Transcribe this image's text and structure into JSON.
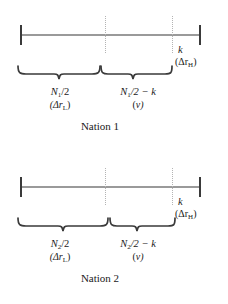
{
  "figure": {
    "type": "diagram",
    "background_color": "#ffffff",
    "axis_color": "#9a9a9a",
    "tick_color": "#3a3a3a",
    "divider_color": "#b4b4b4",
    "brace_color": "#3a3a3a",
    "text_color": "#1a1a1a"
  },
  "panels": [
    {
      "id": "nation-1",
      "caption": "Nation 1",
      "axis": {
        "left_tick_label": "",
        "right_tick_label": "",
        "dividers": 2
      },
      "endpoint_label": {
        "symbol": "k",
        "sub": "(Δr",
        "sub_letter": "H",
        "sub_close": ")"
      },
      "segments": [
        {
          "id": "left",
          "main_prefix": "N",
          "main_sub": "1",
          "main_suffix": "/2",
          "sub_prefix": "(Δr",
          "sub_sub": "L",
          "sub_suffix": ")"
        },
        {
          "id": "right",
          "main_prefix": "N",
          "main_sub": "1",
          "main_suffix": "/2 − k",
          "sub_prefix": "(",
          "sub_sub": "",
          "sub_suffix": "v)"
        }
      ]
    },
    {
      "id": "nation-2",
      "caption": "Nation 2",
      "axis": {
        "left_tick_label": "",
        "right_tick_label": "",
        "dividers": 2
      },
      "endpoint_label": {
        "symbol": "k",
        "sub": "(Δr",
        "sub_letter": "H",
        "sub_close": ")"
      },
      "segments": [
        {
          "id": "left",
          "main_prefix": "N",
          "main_sub": "2",
          "main_suffix": "/2",
          "sub_prefix": "(Δr",
          "sub_sub": "L",
          "sub_suffix": ")"
        },
        {
          "id": "right",
          "main_prefix": "N",
          "main_sub": "2",
          "main_suffix": "/2 − k",
          "sub_prefix": "(",
          "sub_sub": "",
          "sub_suffix": "v)"
        }
      ]
    }
  ]
}
